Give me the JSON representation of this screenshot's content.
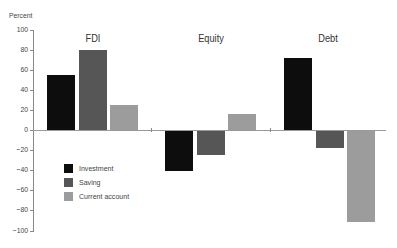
{
  "chart_data": {
    "type": "bar",
    "title": "",
    "xlabel": "",
    "ylabel": "Percent",
    "ylim": [
      -100,
      100
    ],
    "yticks": [
      100,
      80,
      60,
      40,
      20,
      0,
      -20,
      -40,
      -60,
      -80,
      -100
    ],
    "ytick_labels": [
      "100",
      "80",
      "60",
      "40",
      "20",
      "0",
      "−20",
      "−40",
      "−60",
      "−80",
      "−100"
    ],
    "categories": [
      "FDI",
      "Equity",
      "Debt"
    ],
    "series": [
      {
        "name": "Investment",
        "color": "#0d0d0d",
        "values": [
          55,
          -40,
          72
        ]
      },
      {
        "name": "Saving",
        "color": "#565656",
        "values": [
          80,
          -24,
          -17
        ]
      },
      {
        "name": "Current account",
        "color": "#9c9c9c",
        "values": [
          25,
          16,
          -91
        ]
      }
    ],
    "grid": false,
    "legend_position": "inside lower left"
  }
}
